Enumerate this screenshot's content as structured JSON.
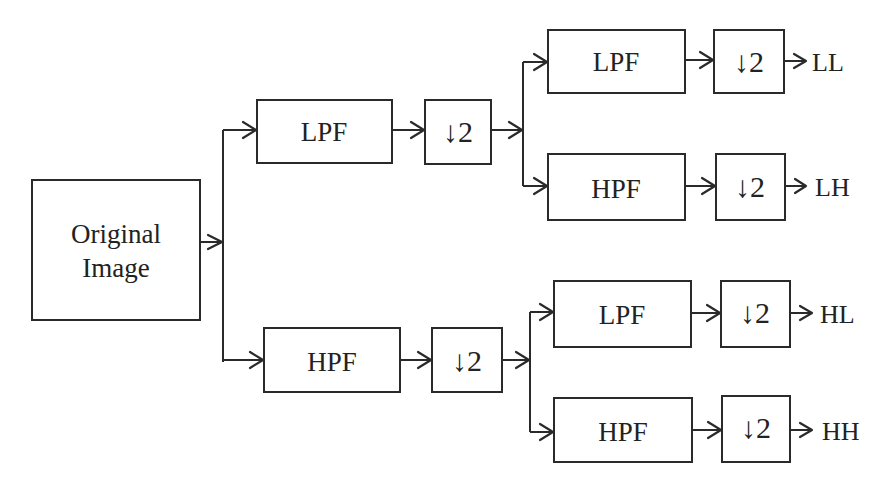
{
  "diagram": {
    "input": {
      "line1": "Original",
      "line2": "Image"
    },
    "level1": {
      "low": {
        "filter": "LPF",
        "downsample": "↓2"
      },
      "high": {
        "filter": "HPF",
        "downsample": "↓2"
      }
    },
    "level2": {
      "LL": {
        "filter": "LPF",
        "downsample": "↓2",
        "output": "LL"
      },
      "LH": {
        "filter": "HPF",
        "downsample": "↓2",
        "output": "LH"
      },
      "HL": {
        "filter": "LPF",
        "downsample": "↓2",
        "output": "HL"
      },
      "HH": {
        "filter": "HPF",
        "downsample": "↓2",
        "output": "HH"
      }
    },
    "colors": {
      "stroke": "#2a2a2a",
      "text": "#222222",
      "background": "#ffffff"
    }
  }
}
